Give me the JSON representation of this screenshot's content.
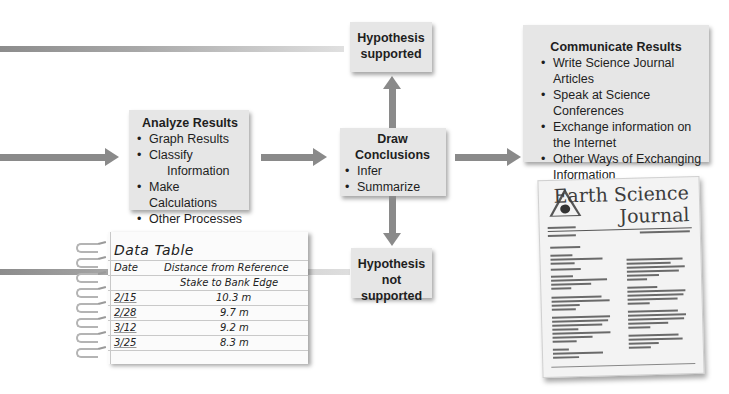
{
  "diagram": {
    "hypothesis_supported": {
      "title": "Hypothesis supported",
      "line1": "Hypothesis",
      "line2": "supported"
    },
    "hypothesis_not_supported": {
      "title": "Hypothesis not supported",
      "line1": "Hypothesis",
      "line2": "not supported"
    },
    "analyze_results": {
      "title": "Analyze Results",
      "items": [
        {
          "label": "Graph Results"
        },
        {
          "label": "Classify",
          "cont": "Information"
        },
        {
          "label": "Make Calculations"
        },
        {
          "label": "Other Processes"
        }
      ]
    },
    "draw_conclusions": {
      "title_line1": "Draw",
      "title_line2": "Conclusions",
      "items": [
        {
          "label": "Infer"
        },
        {
          "label": "Summarize"
        }
      ]
    },
    "communicate_results": {
      "title": "Communicate Results",
      "items": [
        {
          "label": "Write Science Journal Articles"
        },
        {
          "label": "Speak at Science Conferences"
        },
        {
          "label": "Exchange information on",
          "cont": "the Internet"
        },
        {
          "label": "Other Ways of Exchanging",
          "cont": "Information"
        }
      ]
    },
    "colors": {
      "box_bg": "#e6e6e6",
      "arrow": "#8a8a8a",
      "text": "#1e1e1e"
    }
  },
  "data_table": {
    "title": "Data Table",
    "headers": {
      "date": "Date",
      "distance_line1": "Distance from Reference",
      "distance_line2": "Stake to Bank Edge"
    },
    "rows": [
      {
        "date": "2/15",
        "distance": "10.3 m"
      },
      {
        "date": "2/28",
        "distance": "9.7 m"
      },
      {
        "date": "3/12",
        "distance": "9.2 m"
      },
      {
        "date": "3/25",
        "distance": "8.3 m"
      }
    ]
  },
  "journal": {
    "title_line1": "Earth Science",
    "title_line2": "Journal"
  }
}
